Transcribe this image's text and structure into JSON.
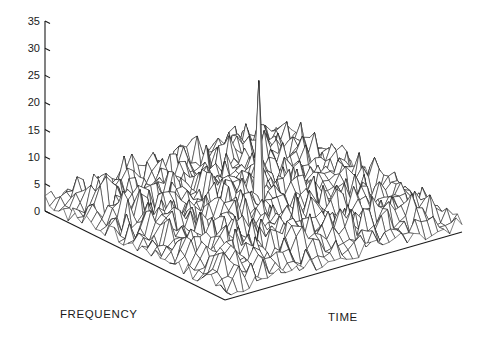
{
  "figure": {
    "kind": "3d-mesh-surface-plot",
    "background_color": "#ffffff",
    "line_color": "#1a1a1a",
    "axis_color": "#1a1a1a"
  },
  "axes": {
    "x_axis_title": "TIME",
    "y_axis_title": "FREQUENCY",
    "z_axis_title": "",
    "z_tick_labels": [
      "0",
      "5",
      "10",
      "15",
      "20",
      "25",
      "30",
      "35"
    ]
  },
  "chart_data": {
    "type": "line",
    "subtype": "3d-mesh-surface",
    "title": "",
    "subtitle": "",
    "xlabel": "TIME",
    "ylabel": "FREQUENCY",
    "zlabel": "",
    "grid": false,
    "legend": "none",
    "legend_position": "none",
    "projection": {
      "type": "isometric-oblique",
      "screen_origin": [
        45,
        211
      ],
      "base_left_corner": [
        45,
        211
      ],
      "base_front_corner": [
        225,
        300
      ],
      "base_right_corner": [
        462,
        232
      ],
      "base_back_corner": [
        278,
        150
      ]
    },
    "z_axis": {
      "ticks": [
        0,
        5,
        10,
        15,
        20,
        25,
        30,
        35
      ],
      "tick_labels": [
        "0",
        "5",
        "10",
        "15",
        "20",
        "25",
        "30",
        "35"
      ],
      "zlim": [
        0,
        35
      ],
      "pixel_at_zero_y": 211,
      "pixel_at_max_y": 21
    },
    "x_axis": {
      "label": "TIME",
      "ticks": [],
      "tick_labels": [],
      "n_samples": 40,
      "xlim": [
        0,
        39
      ]
    },
    "y_axis": {
      "label": "FREQUENCY",
      "ticks": [],
      "tick_labels": [],
      "n_samples": 40,
      "ylim": [
        0,
        39
      ]
    },
    "noise_floor": {
      "typical_min": 0,
      "typical_max": 9,
      "mean_estimate": 3.5
    },
    "peak": {
      "value": 26,
      "grid_index_x": 20,
      "grid_index_y": 20,
      "screen_apex": [
        240,
        72
      ],
      "width_in_cells": 1
    },
    "series": [
      {
        "name": "magnitude",
        "grid_size": [
          40,
          40
        ],
        "z_range": [
          0,
          26
        ],
        "surface_samples_note": "Z values are pseudo-random noise in [0,9] plus a unit-cell spike of 26 at grid (20,20)."
      }
    ]
  }
}
